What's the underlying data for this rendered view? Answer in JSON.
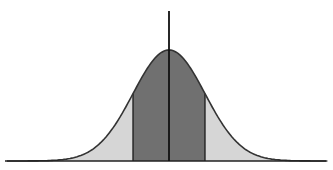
{
  "chart_data": {
    "type": "area",
    "title": "",
    "subtitle": "",
    "xlabel": "",
    "ylabel": "",
    "distribution": "normal",
    "mean": 0,
    "std": 1,
    "xlim": [
      -4.5,
      4.4
    ],
    "shaded_regions": [
      {
        "name": "left-tail",
        "from": -3.5,
        "to": -1,
        "color": "#d6d6d6"
      },
      {
        "name": "center",
        "from": -1,
        "to": 1,
        "color": "#707070"
      },
      {
        "name": "right-tail",
        "from": 1,
        "to": 3.4,
        "color": "#d6d6d6"
      }
    ],
    "mean_line": {
      "x": 0,
      "color": "#111111"
    },
    "region_boundaries": [
      -1,
      1
    ],
    "grid": false,
    "legend": null,
    "tick_labels": []
  },
  "colors": {
    "background": "#ffffff",
    "curve": "#333333",
    "axis": "#222222"
  },
  "layout": {
    "baseline_y": 161,
    "mean_px": 169,
    "sigma_px": 36,
    "peak_y": 50,
    "axis_x0": 5,
    "axis_x1": 326,
    "mean_line_top": 11
  }
}
